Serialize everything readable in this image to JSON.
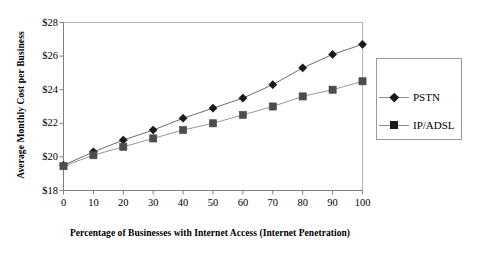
{
  "chart_data": {
    "type": "line",
    "title": "",
    "xlabel": "Percentage of Businesses with Internet Access (Internet Penetration)",
    "ylabel": "Average Monthly Cost per Business",
    "x": [
      0,
      10,
      20,
      30,
      40,
      50,
      60,
      70,
      80,
      90,
      100
    ],
    "xlim": [
      0,
      100
    ],
    "ylim": [
      18,
      28
    ],
    "xticks": [
      "0",
      "10",
      "20",
      "30",
      "40",
      "50",
      "60",
      "70",
      "80",
      "90",
      "100"
    ],
    "yticks": [
      "$18",
      "$20",
      "$22",
      "$24",
      "$26",
      "$28"
    ],
    "ytick_values": [
      18,
      20,
      22,
      24,
      26,
      28
    ],
    "grid": false,
    "legend_position": "right",
    "series": [
      {
        "name": "PSTN",
        "marker": "diamond",
        "color": "#1a1a1a",
        "line_color": "#6e6e6e",
        "values": [
          19.5,
          20.3,
          21.0,
          21.6,
          22.3,
          22.9,
          23.5,
          24.3,
          25.3,
          26.1,
          26.7
        ]
      },
      {
        "name": "IP/ADSL",
        "marker": "square",
        "color": "#4d4d4d",
        "line_color": "#9a9a9a",
        "values": [
          19.45,
          20.1,
          20.6,
          21.1,
          21.6,
          22.0,
          22.5,
          23.0,
          23.6,
          24.0,
          24.5
        ]
      }
    ]
  },
  "legend": {
    "items": [
      {
        "label": "PSTN",
        "marker": "diamond"
      },
      {
        "label": "IP/ADSL",
        "marker": "square"
      }
    ]
  },
  "colors": {
    "axis": "#808080",
    "plot_border": "#b5b5b5",
    "background": "#ffffff",
    "text": "#000000"
  }
}
